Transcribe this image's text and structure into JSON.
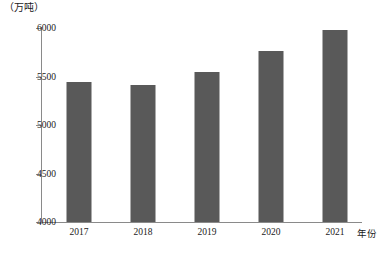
{
  "chart_data": {
    "type": "bar",
    "title": "",
    "subtitle": "",
    "unit_label": "（万吨）",
    "xlabel": "年份",
    "ylabel": "",
    "categories": [
      "2017",
      "2018",
      "2019",
      "2020",
      "2021"
    ],
    "values": [
      5440,
      5415,
      5545,
      5765,
      5980
    ],
    "series": [
      {
        "name": "产量",
        "values": [
          5440,
          5415,
          5545,
          5765,
          5980
        ]
      }
    ],
    "ylim": [
      4000,
      6000
    ],
    "ytick_values": [
      4000,
      4500,
      5000,
      5500,
      6000
    ],
    "ytick_labels": [
      "4000",
      "4500",
      "5000",
      "5500",
      "6000"
    ],
    "grid": false,
    "legend": null,
    "bar_color": "#595959",
    "axis_color": "#8a8a8a"
  }
}
